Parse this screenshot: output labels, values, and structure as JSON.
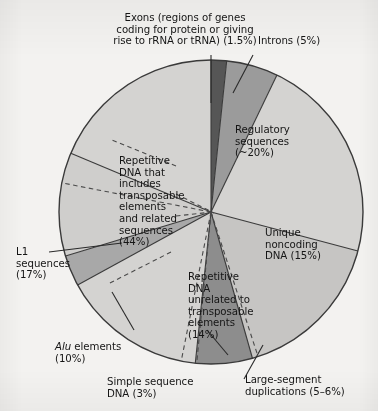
{
  "figure": {
    "background_color": "#f3f2f0",
    "outline_color": "#3a3a3a"
  },
  "chart_data": {
    "type": "pie",
    "title": "",
    "subtitle": "",
    "xlabel": "",
    "ylabel": "",
    "grid": false,
    "legend_position": "none",
    "units": "percent of human genome",
    "start_angle_deg": 0,
    "direction": "clockwise",
    "center_px": [
      211,
      212
    ],
    "radius_px": 152,
    "categories": [
      "Exons (regions of genes coding for protein or giving rise to rRNA or tRNA)",
      "Introns",
      "Regulatory sequences",
      "Unique noncoding DNA",
      "Large-segment duplications",
      "Repetitive DNA unrelated to transposable elements",
      "Simple sequence DNA",
      "Alu elements",
      "L1 sequences"
    ],
    "values": [
      1.5,
      5,
      20,
      15,
      5.5,
      14,
      3,
      10,
      17
    ],
    "value_labels": [
      "1.5%",
      "5%",
      "~20%",
      "15%",
      "5–6%",
      "14%",
      "3%",
      "10%",
      "17%"
    ],
    "slice_colors": [
      "#565656",
      "#9b9b9b",
      "#d4d3d1",
      "#c6c5c3",
      "#8d8d8d",
      "#d4d3d1",
      "#a8a8a8",
      "#cfcecc",
      "#d4d3d1"
    ],
    "groups": [
      {
        "name": "Repetitive DNA that includes transposable elements and related sequences",
        "value": 44,
        "value_label": "44%",
        "members": [
          "L1 sequences",
          "Alu elements",
          "other transposable elements"
        ],
        "bracket_style": "dashed"
      }
    ]
  },
  "labels": {
    "exons": "Exons (regions of genes\ncoding for protein or giving\nrise to rRNA or tRNA) (1.5%)",
    "introns": "Introns (5%)",
    "regulatory": "Regulatory\nsequences\n(~20%)",
    "unique_noncoding": "Unique\nnoncoding\nDNA (15%)",
    "large_segment": "Large-segment\nduplications (5–6%)",
    "repetitive_unrelated": "Repetitive\nDNA\nunrelated to\ntransposable\nelements\n(14%)",
    "simple_sequence": "Simple sequence\nDNA (3%)",
    "alu_italic": "Alu",
    "alu_rest": " elements\n(10%)",
    "l1": "L1\nsequences\n(17%)",
    "repetitive_includes": "Repetitive\nDNA that\nincludes\ntransposable\nelements\nand related\nsequences\n(44%)"
  }
}
